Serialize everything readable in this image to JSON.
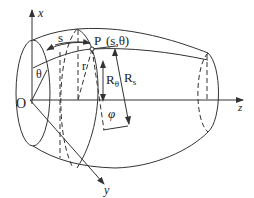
{
  "diagram": {
    "type": "3d-shell-of-revolution-coordinate-system",
    "axes": {
      "x": "x",
      "y": "y",
      "z": "z",
      "origin": "O"
    },
    "labels": {
      "point": "P",
      "point_coords": "(s,θ)",
      "arc_length": "s",
      "circumferential_angle": "θ",
      "radius": "r",
      "radius_theta": "R",
      "radius_theta_sub": "θ",
      "radius_s": "R",
      "radius_s_sub": "s",
      "meridian_angle": "φ"
    },
    "colors": {
      "line": "#333333",
      "background": "#ffffff"
    }
  }
}
